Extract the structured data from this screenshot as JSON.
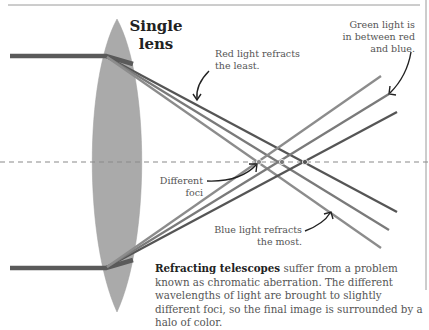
{
  "title": "Single lens",
  "title_lines": [
    "Single",
    "lens"
  ],
  "labels": {
    "red": [
      "Red light refracts",
      "the least."
    ],
    "green": [
      "Green light is",
      "in between red",
      "and blue."
    ],
    "foci": [
      "Different",
      "foci"
    ],
    "blue": [
      "Blue light refracts",
      "the most."
    ]
  },
  "caption": {
    "bold": "Refracting telescopes",
    "text": " suffer from a problem known as chromatic aberration. The different wavelengths of light are brought to slightly different foci, so the final image is surrounded by a halo of color."
  },
  "colors": {
    "lens": "#aaaaaa",
    "incoming_ray": "#5a5a5a",
    "red_ray": "#555555",
    "green_ray": "#7a7a7a",
    "blue_ray": "#8c8c8c",
    "axis": "#888888",
    "text": "#555555"
  }
}
